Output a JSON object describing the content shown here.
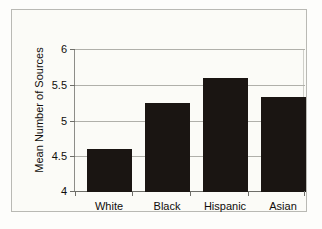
{
  "chart_data": {
    "type": "bar",
    "title": "",
    "xlabel": "",
    "ylabel": "Mean Number of Sources",
    "categories": [
      "White",
      "Black",
      "Hispanic",
      "Asian"
    ],
    "values": [
      4.6,
      5.25,
      5.6,
      5.33
    ],
    "ylim": [
      4,
      6
    ],
    "ytick_labels": [
      "4",
      "4.5",
      "5",
      "5.5",
      "6"
    ],
    "ytick_values": [
      4,
      4.5,
      5,
      5.5,
      6
    ],
    "grid": true,
    "legend": false,
    "bar_color": "#1a1512",
    "grid_color": "#b0b0aa",
    "axis_color": "#6e6e69",
    "background_color": "#fbfbf7",
    "frame_color": "#b9b9b4"
  }
}
